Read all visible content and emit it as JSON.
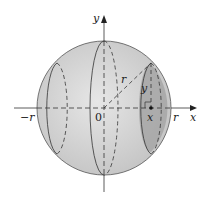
{
  "diagram": {
    "labels": {
      "y_axis": "y",
      "x_axis": "x",
      "neg_r": "−r",
      "origin": "0",
      "pos_r": "r",
      "x_point": "x",
      "radius": "r",
      "y_height": "y"
    },
    "colors": {
      "sphere_fill": "#d4d4d4",
      "slice_fill": "#a9a9a9",
      "outline": "#333333"
    }
  }
}
